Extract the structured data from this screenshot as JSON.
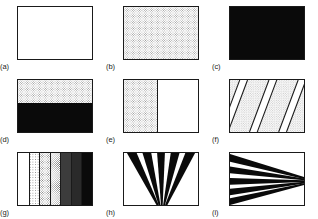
{
  "figure": {
    "type": "texture-sample-grid",
    "columns": 3,
    "rows": 3,
    "background_color": "#ffffff",
    "border_color": "#1a1a1a",
    "ink_color": "#0a0a0a",
    "stipple_color": "#9a9a9a"
  },
  "panels": [
    {
      "id": "a",
      "label": "(a)",
      "pattern": "uniform-white",
      "description": "blank white field"
    },
    {
      "id": "b",
      "label": "(b)",
      "pattern": "uniform-stipple",
      "description": "uniform fine stipple texture"
    },
    {
      "id": "c",
      "label": "(c)",
      "pattern": "uniform-black",
      "description": "solid black field"
    },
    {
      "id": "d",
      "label": "(d)",
      "pattern": "horizontal-split",
      "description": "stipple upper region over solid black lower region",
      "split_fraction": 0.45
    },
    {
      "id": "e",
      "label": "(e)",
      "pattern": "vertical-split",
      "description": "stipple left region beside white right region",
      "split_fraction": 0.45
    },
    {
      "id": "f",
      "label": "(f)",
      "pattern": "diagonal-stripes",
      "description": "alternating stipple and white diagonal bands",
      "stripe_count": 4,
      "angle_degrees": 60
    },
    {
      "id": "g",
      "label": "(g)",
      "pattern": "density-gradient-bands",
      "description": "vertical bands stepping from white to black",
      "band_count": 7,
      "band_densities": [
        0,
        1,
        2,
        3,
        4,
        5,
        6
      ]
    },
    {
      "id": "h",
      "label": "(h)",
      "pattern": "radial-fan-bottom",
      "description": "black wedges converging toward a point below the bottom edge",
      "wedge_count": 5
    },
    {
      "id": "i",
      "label": "(i)",
      "pattern": "radial-fan-right",
      "description": "black wedges converging toward a point at the right edge",
      "wedge_count": 5
    }
  ]
}
